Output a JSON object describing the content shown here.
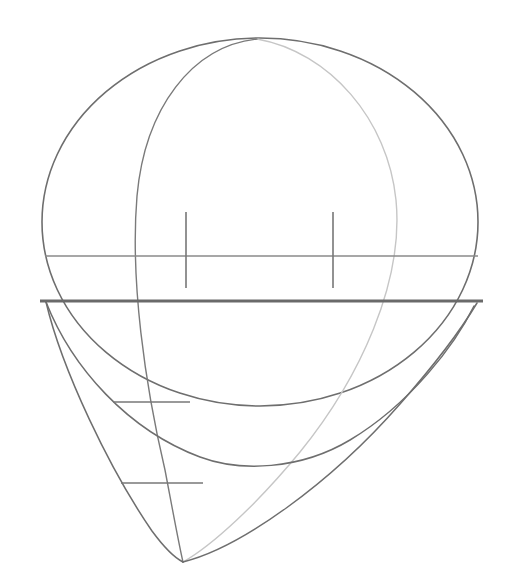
{
  "canvas": {
    "width": 514,
    "height": 583,
    "background": "#ffffff"
  },
  "figure": {
    "kind": "geometric-line-drawing"
  },
  "colors": {
    "outline": "#6e6e6e",
    "thin_line": "#8a8a8a",
    "thick_line": "#6a6a6a",
    "faint_line": "#c6c6c6",
    "tick": "#777777",
    "background": "#ffffff"
  },
  "geometry": {
    "sphere_outline": {
      "center_x": 260,
      "center_y": 222,
      "radius_x": 218,
      "radius_y": 184,
      "stroke_width": 1.6
    },
    "horizontal_chord": {
      "label": "thin-horizontal-chord",
      "y": 256,
      "x_start": 45,
      "x_end": 478,
      "stroke_width": 1.3
    },
    "equator_line": {
      "label": "thick-horizontal-equator",
      "y": 301,
      "x_start": 40,
      "x_end": 483,
      "stroke_width": 3.2
    },
    "top_apex": {
      "x": 257,
      "y": 39
    },
    "bottom_apex": {
      "x": 183,
      "y": 562
    },
    "meridian_left": {
      "label": "left-meridian-ellipse",
      "stroke_width": 1.4
    },
    "meridian_right_faint": {
      "label": "right-meridian-ellipse-faint",
      "stroke_width": 1.3
    },
    "lower_bowl": {
      "label": "lower-bowl-curve",
      "min_x": 275,
      "min_y": 466
    },
    "lower_outer": {
      "label": "lower-outer-teardrop-curve",
      "stroke_width": 1.5
    }
  },
  "ticks": {
    "vertical": [
      {
        "name": "tick-upper-left",
        "x": 186,
        "y_top": 212,
        "y_bottom": 288,
        "stroke_width": 1.6
      },
      {
        "name": "tick-upper-right",
        "x": 333,
        "y_top": 212,
        "y_bottom": 288,
        "stroke_width": 1.6
      }
    ],
    "horizontal": [
      {
        "name": "tick-lower-upper",
        "y": 402,
        "x_start": 113,
        "x_end": 190,
        "stroke_width": 1.6
      },
      {
        "name": "tick-lower-lower",
        "y": 483,
        "x_start": 121,
        "x_end": 203,
        "stroke_width": 1.6
      }
    ]
  },
  "labels": {
    "none_present": ""
  }
}
